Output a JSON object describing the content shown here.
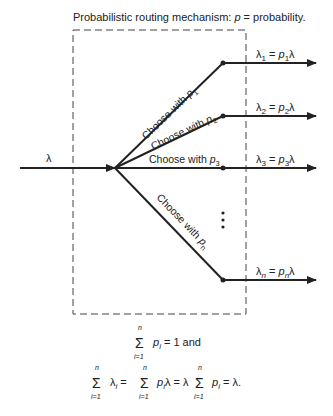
{
  "title": {
    "prefix": "Probabilistic routing mechanism: ",
    "var": "p",
    "suffix": " = probability."
  },
  "input": {
    "label": "λ"
  },
  "branches": [
    {
      "choose_text": "Choose with ",
      "p": "p",
      "sub": "1",
      "out_lhs": "λ",
      "out_sub": "1",
      "out_eq": " = ",
      "out_p": "p",
      "out_psub": "1",
      "out_rhs": "λ"
    },
    {
      "choose_text": "Choose with ",
      "p": "p",
      "sub": "2",
      "out_lhs": "λ",
      "out_sub": "2",
      "out_eq": " = ",
      "out_p": "p",
      "out_psub": "2",
      "out_rhs": "λ"
    },
    {
      "choose_text": "Choose with ",
      "p": "p",
      "sub": "3",
      "out_lhs": "λ",
      "out_sub": "3",
      "out_eq": " = ",
      "out_p": "p",
      "out_psub": "3",
      "out_rhs": "λ"
    },
    {
      "choose_text": "Choose with ",
      "p": "p",
      "sub": "n",
      "out_lhs": "λ",
      "out_sub": "n",
      "out_eq": " = ",
      "out_p": "p",
      "out_psub": "n",
      "out_rhs": "λ"
    }
  ],
  "ellipsis": "⋮",
  "formulas": {
    "sum_symbol": "Σ",
    "upper": "n",
    "lower": "i=1",
    "line1": {
      "term": "p",
      "sub": "i",
      "rest": " = 1 and"
    },
    "line2": {
      "t1": "λ",
      "t1sub": "i",
      "eq1": " = ",
      "t2": "p",
      "t2sub": "i",
      "t2rest": "λ = λ ",
      "t3": "p",
      "t3sub": "i",
      "t3rest": " = λ."
    }
  }
}
